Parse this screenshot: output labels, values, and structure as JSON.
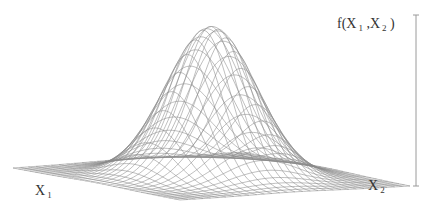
{
  "chart_data": {
    "type": "surface",
    "title": "",
    "function": "bivariate normal density f(X1,X2)",
    "xlabel": "X",
    "xlabel_sub": "1",
    "ylabel": "X",
    "ylabel_sub": "2",
    "zlabel_prefix": "f(X",
    "zlabel_sub1": "1",
    "zlabel_mid": " ,X",
    "zlabel_sub2": "2",
    "zlabel_suffix": " )",
    "grid": {
      "x_lines": 30,
      "y_lines": 30
    },
    "surface": {
      "peak_center": [
        0.5,
        0.5
      ],
      "spread": 0.16
    },
    "axis_ticks": false,
    "line_color": "#8a8a8a",
    "axis_color": "#999999"
  }
}
